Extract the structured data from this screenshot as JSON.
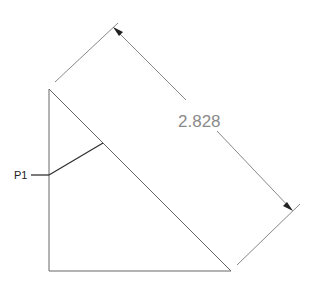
{
  "dimension": {
    "value_text": "2.828",
    "color": "#8a8a8a"
  },
  "point_label": {
    "text": "P1",
    "color": "#222222"
  },
  "triangle": {
    "vertices": [
      [
        49,
        89
      ],
      [
        49,
        271
      ],
      [
        231,
        271
      ]
    ],
    "color": "#555555"
  }
}
